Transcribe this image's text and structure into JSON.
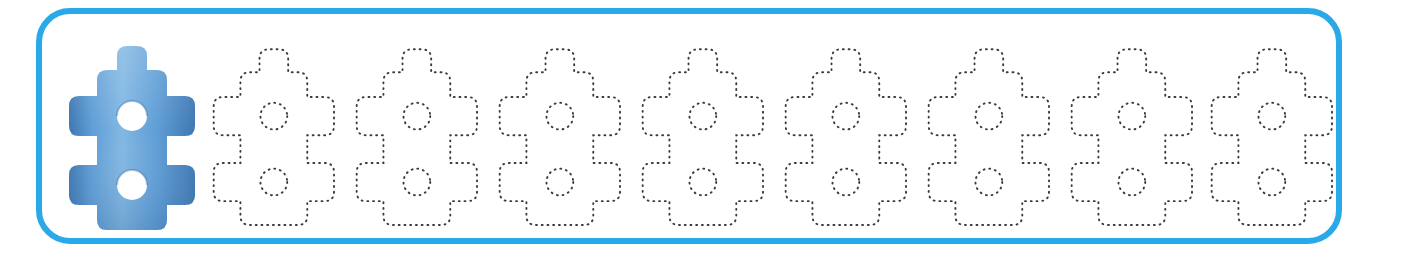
{
  "worksheet": {
    "kind": "shape-tracing-row",
    "frame": {
      "border_color": "#29a9e8",
      "border_width_px": 6,
      "corner_radius_px": 34,
      "fill": "none"
    },
    "shape": {
      "name": "machine-part-puzzle-piece",
      "description": "Vertical rounded body with one top nub, two left tabs, two right tabs and two round holes",
      "holes": 2,
      "tabs_left": 2,
      "tabs_right": 2,
      "nubs_top": 1
    },
    "model": {
      "index": 0,
      "style": "filled",
      "label": "model-shape",
      "fill_light": "#7fb6e2",
      "fill_mid": "#5b9bd5",
      "fill_dark": "#3a74b0",
      "hole_fill": "#ffffff",
      "x_px": 62,
      "width_px": 140,
      "height_px": 205
    },
    "traces": {
      "count": 8,
      "style": "dotted-outline",
      "stroke_color": "#3a3a3a",
      "stroke_width_px": 2,
      "dash_pattern": "1 5",
      "first_x_px": 205,
      "pitch_px": 143,
      "width_px": 134,
      "height_px": 196,
      "items": [
        {
          "index": 1,
          "x_px": 205,
          "label": "trace-shape-1"
        },
        {
          "index": 2,
          "x_px": 348,
          "label": "trace-shape-2"
        },
        {
          "index": 3,
          "x_px": 491,
          "label": "trace-shape-3"
        },
        {
          "index": 4,
          "x_px": 634,
          "label": "trace-shape-4"
        },
        {
          "index": 5,
          "x_px": 777,
          "label": "trace-shape-5"
        },
        {
          "index": 6,
          "x_px": 920,
          "label": "trace-shape-6"
        },
        {
          "index": 7,
          "x_px": 1063,
          "label": "trace-shape-7"
        },
        {
          "index": 8,
          "x_px": 1203,
          "label": "trace-shape-8"
        }
      ]
    }
  }
}
